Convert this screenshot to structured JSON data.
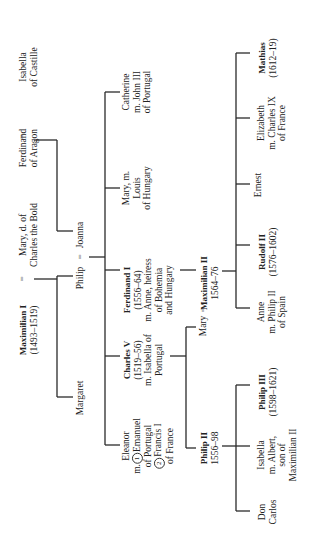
{
  "orientation": "rotated 90 degrees counter-clockwise",
  "generation1": {
    "maximilian_i": {
      "name": "Maximilian I",
      "dates": "(1493–1519)"
    },
    "mary_burgundy": {
      "line1": "Mary, d. of",
      "line2": "Charles the Bold"
    },
    "ferdinand_aragon": {
      "line1": "Ferdinand",
      "line2": "of Aragon"
    },
    "isabella_castille": {
      "line1": "Isabella",
      "line2": "of Castille"
    },
    "marriage_sign": "="
  },
  "generation2": {
    "margaret": "Margaret",
    "philip": "Philip",
    "joanna": "Joanna",
    "marriage_sign": "="
  },
  "generation3": {
    "eleanor": {
      "line1": "Eleanor",
      "line2_prefix": "m.",
      "circle1": "1",
      "line2": "Emanuel",
      "line3": "of Portugal",
      "circle2": "2",
      "line4": "Francis I",
      "line5": "of France"
    },
    "charles_v": {
      "name": "Charles V",
      "dates": "(1519–56)",
      "line3": "m. Isabella of",
      "line4": "Portugal"
    },
    "ferdinand_i": {
      "name": "Ferdinand I",
      "dates": "(1556–64)",
      "line3": "m. Anne, heiress",
      "line4": "of Bohemia",
      "line5": "and Hungary"
    },
    "mary_hungary": {
      "line1": "Mary, m.",
      "line2": "Louis",
      "line3": "of Hungary"
    },
    "catherine": {
      "line1": "Catherine",
      "line2": "m. John III",
      "line3": "of Portugal"
    }
  },
  "generation4": {
    "philip_ii": {
      "name": "Philip II",
      "dates": "1556–98"
    },
    "mary": "Mary",
    "maximilian_ii": {
      "name": "Maximilian II",
      "dates": "1564–76"
    },
    "marriage_sign": "="
  },
  "generation5": {
    "don_carlos": {
      "line1": "Don",
      "line2": "Carlos"
    },
    "isabella": {
      "line1": "Isabella",
      "line2": "m. Albert,",
      "line3": "son of",
      "line4": "Maximilian II"
    },
    "philip_iii": {
      "name": "Philip III",
      "dates": "(1598–1621)"
    },
    "anne": {
      "line1": "Anne",
      "line2": "m. Philip II",
      "line3": "of Spain"
    },
    "rudolf_ii": {
      "name": "Rudolf II",
      "dates": "(1576–1602)"
    },
    "ernest": "Ernest",
    "elizabeth": {
      "line1": "Elizabeth",
      "line2": "m. Charles IX",
      "line3": "of France"
    },
    "mathias": {
      "name": "Mathias",
      "dates": "(1612–19)"
    }
  }
}
